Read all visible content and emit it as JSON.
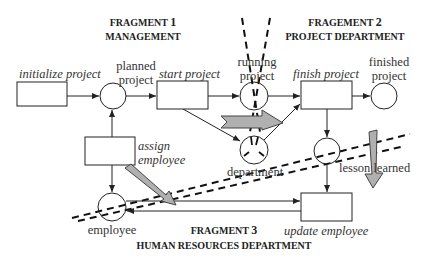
{
  "fragments": [
    {
      "title": "FRAGMENT",
      "number": "1",
      "subtitle": "MANAGEMENT"
    },
    {
      "title": "FRAGEMENT",
      "number": "2",
      "subtitle": "PROJECT DEPARTMENT"
    },
    {
      "title": "FRAGMENT",
      "number": "3",
      "subtitle": "HUMAN RESOURCES DEPARTMENT"
    }
  ],
  "transitions": {
    "initialize_project": "initialize project",
    "start_project": "start project",
    "finish_project": "finish project",
    "assign_employee_line1": "assign",
    "assign_employee_line2": "employee",
    "update_employee": "update employee"
  },
  "places": {
    "planned_project_line1": "planned",
    "planned_project_line2": "project",
    "running_project_line1": "running",
    "running_project_line2": "project",
    "finished_project_line1": "finished",
    "finished_project_line2": "project",
    "department": "department",
    "lesson_learned": "lesson learned",
    "employee": "employee"
  },
  "colors": {
    "stroke": "#333333",
    "fat_arrow_fill": "#b0b0b0",
    "text": "#333333"
  }
}
